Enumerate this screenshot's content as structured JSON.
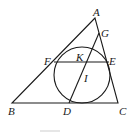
{
  "diagram": {
    "type": "geometry",
    "points": {
      "A": {
        "label": "A",
        "x": 95,
        "y": 18
      },
      "B": {
        "label": "B",
        "x": 12,
        "y": 103
      },
      "C": {
        "label": "C",
        "x": 118,
        "y": 103
      },
      "D": {
        "label": "D",
        "x": 69,
        "y": 103
      },
      "E": {
        "label": "E",
        "x": 109,
        "y": 62
      },
      "F": {
        "label": "F",
        "x": 54,
        "y": 62
      },
      "G": {
        "label": "G",
        "x": 99,
        "y": 33
      },
      "K": {
        "label": "K",
        "x": 82,
        "y": 62
      },
      "I": {
        "label": "I",
        "x": 82,
        "y": 73
      }
    },
    "circle": {
      "center": "I",
      "cx": 82,
      "cy": 73,
      "r": 28
    },
    "segments": [
      [
        "A",
        "B"
      ],
      [
        "B",
        "C"
      ],
      [
        "C",
        "A"
      ],
      [
        "F",
        "E"
      ],
      [
        "D",
        "G"
      ]
    ]
  }
}
